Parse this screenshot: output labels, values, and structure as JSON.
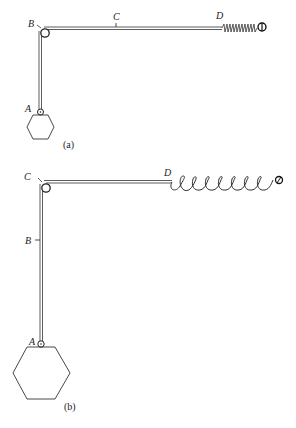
{
  "figure_a": {
    "caption": "(a)",
    "labels": {
      "pulley": "B",
      "midpoint": "C",
      "spring_start": "D",
      "mass_attach": "A"
    }
  },
  "figure_b": {
    "caption": "(b)",
    "labels": {
      "pulley": "C",
      "midpoint": "B",
      "spring_start": "D",
      "mass_attach": "A"
    }
  },
  "colors": {
    "ink": "#333333",
    "background": "#ffffff"
  }
}
